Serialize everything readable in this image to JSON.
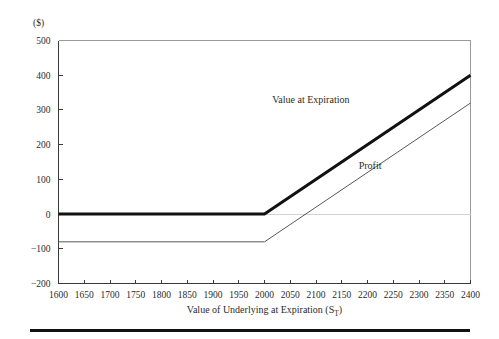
{
  "figure": {
    "unit_label": "($)",
    "width": 499,
    "height": 339
  },
  "chart_data": {
    "type": "line",
    "title": "",
    "subtitle": "",
    "xlabel": "Value of Underlying at Expiration (S",
    "xlabel_sub": "T",
    "xlabel_tail": ")",
    "ylabel": "($)",
    "xlim": [
      1600,
      2400
    ],
    "ylim": [
      -200,
      500
    ],
    "xticks": [
      1600,
      1650,
      1700,
      1750,
      1800,
      1850,
      1900,
      1950,
      2000,
      2050,
      2100,
      2150,
      2200,
      2250,
      2300,
      2350,
      2400
    ],
    "yticks": [
      500,
      400,
      300,
      200,
      100,
      0,
      -100,
      -200
    ],
    "xticklabels": [
      "1600",
      "1650",
      "1700",
      "1750",
      "1800",
      "1850",
      "1900",
      "1950",
      "2000",
      "2050",
      "2100",
      "2150",
      "2200",
      "2250",
      "2300",
      "2350",
      "2400"
    ],
    "yticklabels": [
      "500",
      "400",
      "300",
      "200",
      "100",
      "0",
      "-100",
      "-200"
    ],
    "grid": false,
    "legend_position": "inline-annotations",
    "zero_reference_line": 0,
    "strike": 2000,
    "premium": 80,
    "series": [
      {
        "name": "Value at Expiration",
        "style": "thick",
        "color": "#111111",
        "x": [
          1600,
          2000,
          2400
        ],
        "values": [
          0,
          0,
          400
        ],
        "label": "Value  at Expiration",
        "label_x": 2090,
        "label_y": 320
      },
      {
        "name": "Profit",
        "style": "thin",
        "color": "#585858",
        "x": [
          1600,
          2000,
          2400
        ],
        "values": [
          -80,
          -80,
          320
        ],
        "label": "Profit",
        "label_x": 2205,
        "label_y": 130
      }
    ]
  }
}
